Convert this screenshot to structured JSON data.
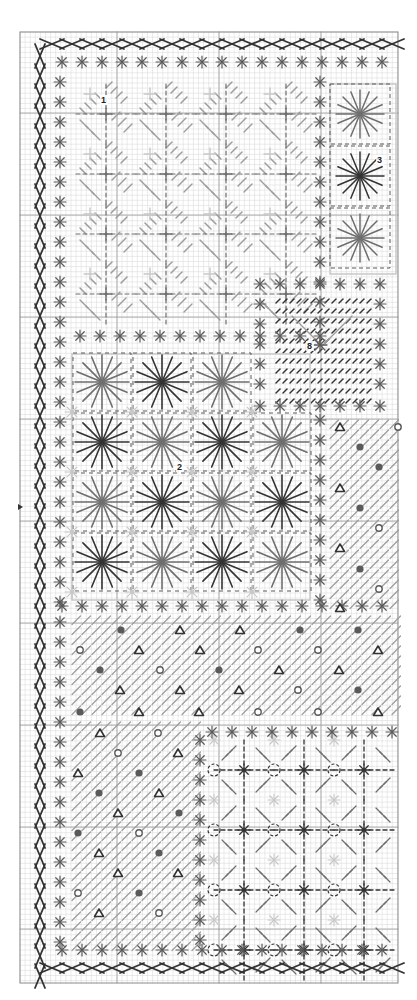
{
  "diagram": {
    "type": "needlepoint-stitch-chart",
    "grid": {
      "x0": 20,
      "y0": 32,
      "x1": 398,
      "y1": 983,
      "cell": 5.1,
      "major_x": [
        117,
        219,
        321
      ],
      "major_y": [
        113,
        215,
        317,
        419,
        521,
        623,
        725,
        827,
        929
      ],
      "minor_color": "#d6d6d6",
      "major_color": "#9a9a9a",
      "frame_color": "#8a8a8a"
    },
    "colors": {
      "dark": "#333333",
      "mid": "#5a5a5a",
      "medium": "#6e6e6e",
      "light": "#9c9c9c",
      "pale": "#c8c8c8"
    },
    "section_labels": [
      {
        "id": "1",
        "text": "1",
        "x": 101,
        "y": 103
      },
      {
        "id": "2",
        "text": "2",
        "x": 177,
        "y": 470
      },
      {
        "id": "3",
        "text": "3",
        "x": 377,
        "y": 163
      },
      {
        "id": "8",
        "text": "8",
        "x": 307,
        "y": 349
      }
    ],
    "row_marker": {
      "symbol": "arrow-right",
      "y": 507
    },
    "regions": {
      "section1": {
        "x": 76,
        "y": 84,
        "w": 246,
        "h": 244,
        "pattern": "diagonal-diamond"
      },
      "section3": {
        "x": 330,
        "y": 84,
        "w": 66,
        "h": 190,
        "pattern": "large-star"
      },
      "section8": {
        "x": 272,
        "y": 296,
        "w": 104,
        "h": 120,
        "pattern": "small-diagonal-dashes"
      },
      "section2": {
        "x": 72,
        "y": 354,
        "w": 238,
        "h": 246,
        "pattern": "large-star-grid"
      },
      "right_mid": {
        "x": 326,
        "y": 420,
        "w": 72,
        "h": 185,
        "pattern": "hatch-symbols"
      },
      "lower_wide": {
        "x": 72,
        "y": 620,
        "w": 326,
        "h": 95,
        "pattern": "hatch-symbols"
      },
      "bottom_left": {
        "x": 72,
        "y": 720,
        "w": 140,
        "h": 230,
        "pattern": "hatch-symbols"
      },
      "bottom_right": {
        "x": 214,
        "y": 740,
        "w": 184,
        "h": 210,
        "pattern": "octagon-lattice"
      }
    },
    "borders": {
      "cross_border_top_y": 44,
      "cross_border_bottom_y": 968,
      "cross_border_left_x": 40,
      "asterisk_row_top_y": 62,
      "asterisk_row_bottom_y": 950,
      "asterisk_col_left_x": 60,
      "asterisk_spacing": 20
    },
    "stars_section2": [
      {
        "col": 0,
        "row": 0,
        "shade": "medium"
      },
      {
        "col": 1,
        "row": 0,
        "shade": "dark"
      },
      {
        "col": 2,
        "row": 0,
        "shade": "medium"
      },
      {
        "col": 0,
        "row": 1,
        "shade": "dark"
      },
      {
        "col": 1,
        "row": 1,
        "shade": "medium"
      },
      {
        "col": 2,
        "row": 1,
        "shade": "dark"
      },
      {
        "col": 3,
        "row": 1,
        "shade": "medium"
      },
      {
        "col": 0,
        "row": 2,
        "shade": "medium"
      },
      {
        "col": 1,
        "row": 2,
        "shade": "dark"
      },
      {
        "col": 2,
        "row": 2,
        "shade": "medium"
      },
      {
        "col": 3,
        "row": 2,
        "shade": "dark"
      },
      {
        "col": 0,
        "row": 3,
        "shade": "dark"
      },
      {
        "col": 1,
        "row": 3,
        "shade": "medium"
      },
      {
        "col": 2,
        "row": 3,
        "shade": "dark"
      },
      {
        "col": 3,
        "row": 3,
        "shade": "medium"
      }
    ],
    "stars_section3": [
      {
        "row": 0,
        "shade": "medium"
      },
      {
        "row": 1,
        "shade": "dark"
      },
      {
        "row": 2,
        "shade": "medium"
      }
    ],
    "symbols": [
      {
        "t": "dot",
        "x": 121,
        "y": 630
      },
      {
        "t": "tri",
        "x": 180,
        "y": 630
      },
      {
        "t": "tri",
        "x": 240,
        "y": 630
      },
      {
        "t": "dot",
        "x": 300,
        "y": 630
      },
      {
        "t": "dot",
        "x": 358,
        "y": 630
      },
      {
        "t": "ring",
        "x": 80,
        "y": 650
      },
      {
        "t": "tri",
        "x": 139,
        "y": 650
      },
      {
        "t": "tri",
        "x": 200,
        "y": 650
      },
      {
        "t": "ring",
        "x": 258,
        "y": 650
      },
      {
        "t": "ring",
        "x": 318,
        "y": 650
      },
      {
        "t": "tri",
        "x": 378,
        "y": 650
      },
      {
        "t": "dot",
        "x": 100,
        "y": 670
      },
      {
        "t": "ring",
        "x": 160,
        "y": 670
      },
      {
        "t": "dot",
        "x": 219,
        "y": 670
      },
      {
        "t": "tri",
        "x": 279,
        "y": 670
      },
      {
        "t": "tri",
        "x": 339,
        "y": 670
      },
      {
        "t": "tri",
        "x": 120,
        "y": 690
      },
      {
        "t": "tri",
        "x": 180,
        "y": 690
      },
      {
        "t": "tri",
        "x": 239,
        "y": 690
      },
      {
        "t": "ring",
        "x": 298,
        "y": 690
      },
      {
        "t": "dot",
        "x": 358,
        "y": 690
      },
      {
        "t": "dot",
        "x": 80,
        "y": 712
      },
      {
        "t": "tri",
        "x": 139,
        "y": 712
      },
      {
        "t": "tri",
        "x": 199,
        "y": 712
      },
      {
        "t": "ring",
        "x": 258,
        "y": 712
      },
      {
        "t": "ring",
        "x": 318,
        "y": 712
      },
      {
        "t": "tri",
        "x": 378,
        "y": 712
      },
      {
        "t": "tri",
        "x": 100,
        "y": 733
      },
      {
        "t": "ring",
        "x": 158,
        "y": 733
      },
      {
        "t": "ring",
        "x": 118,
        "y": 753
      },
      {
        "t": "tri",
        "x": 178,
        "y": 753
      },
      {
        "t": "tri",
        "x": 78,
        "y": 773
      },
      {
        "t": "dot",
        "x": 139,
        "y": 773
      },
      {
        "t": "dot",
        "x": 99,
        "y": 793
      },
      {
        "t": "tri",
        "x": 159,
        "y": 793
      },
      {
        "t": "tri",
        "x": 118,
        "y": 813
      },
      {
        "t": "dot",
        "x": 179,
        "y": 813
      },
      {
        "t": "dot",
        "x": 78,
        "y": 833
      },
      {
        "t": "ring",
        "x": 139,
        "y": 833
      },
      {
        "t": "tri",
        "x": 99,
        "y": 853
      },
      {
        "t": "dot",
        "x": 159,
        "y": 853
      },
      {
        "t": "tri",
        "x": 118,
        "y": 873
      },
      {
        "t": "tri",
        "x": 178,
        "y": 873
      },
      {
        "t": "ring",
        "x": 78,
        "y": 893
      },
      {
        "t": "dot",
        "x": 139,
        "y": 893
      },
      {
        "t": "tri",
        "x": 99,
        "y": 913
      },
      {
        "t": "ring",
        "x": 159,
        "y": 913
      },
      {
        "t": "tri",
        "x": 340,
        "y": 427
      },
      {
        "t": "ring",
        "x": 398,
        "y": 427
      },
      {
        "t": "dot",
        "x": 360,
        "y": 447
      },
      {
        "t": "dot",
        "x": 379,
        "y": 467
      },
      {
        "t": "tri",
        "x": 340,
        "y": 488
      },
      {
        "t": "dot",
        "x": 360,
        "y": 508
      },
      {
        "t": "ring",
        "x": 379,
        "y": 528
      },
      {
        "t": "tri",
        "x": 340,
        "y": 548
      },
      {
        "t": "dot",
        "x": 360,
        "y": 569
      },
      {
        "t": "ring",
        "x": 379,
        "y": 589
      },
      {
        "t": "tri",
        "x": 340,
        "y": 608
      }
    ]
  }
}
